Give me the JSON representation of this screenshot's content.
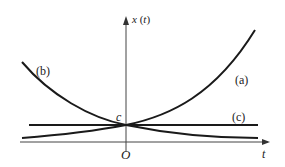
{
  "diagram": {
    "axes": {
      "y_label_var": "x",
      "y_label_arg": "t",
      "x_label": "t",
      "origin_label": "O",
      "intercept_label": "c"
    },
    "curves": [
      {
        "id": "a",
        "label": "(a)",
        "description": "exponential growth through (0, c)"
      },
      {
        "id": "b",
        "label": "(b)",
        "description": "exponential decay through (0, c)"
      },
      {
        "id": "c",
        "label": "(c)",
        "description": "constant line x = c"
      }
    ],
    "colors": {
      "stroke": "#1a1a1a",
      "background": "#ffffff"
    }
  }
}
